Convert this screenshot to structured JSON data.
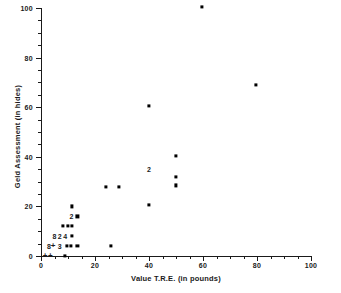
{
  "chart_data": {
    "type": "scatter",
    "title": "",
    "xlabel": "Value T.R.E. (in pounds)",
    "ylabel": "Geld Assessment (in hides)",
    "xlim": [
      0,
      100
    ],
    "ylim": [
      0,
      100
    ],
    "grid": false,
    "legend": false,
    "x_ticks_major": [
      0,
      20,
      40,
      60,
      80,
      100
    ],
    "x_ticks_minor": [
      5,
      10,
      15,
      25,
      30,
      35,
      45,
      50,
      55,
      65,
      70,
      75,
      85,
      90,
      95
    ],
    "y_ticks_major": [
      0,
      20,
      40,
      60,
      80,
      100
    ],
    "y_ticks_minor": [
      5,
      10,
      15,
      25,
      30,
      35,
      45,
      50,
      55,
      65,
      70,
      75,
      85,
      90,
      95
    ],
    "x_tick_labels": [
      "0",
      "20",
      "40",
      "60",
      "80",
      "100"
    ],
    "y_tick_labels": [
      "0",
      "20",
      "40",
      "60",
      "80",
      "100"
    ],
    "points": [
      {
        "x": 59.5,
        "y": 100.5
      },
      {
        "x": 79.5,
        "y": 69.0
      },
      {
        "x": 40.0,
        "y": 60.5
      },
      {
        "x": 50.0,
        "y": 40.5
      },
      {
        "x": 50.0,
        "y": 32.0
      },
      {
        "x": 50.0,
        "y": 28.5
      },
      {
        "x": 24.0,
        "y": 28.0
      },
      {
        "x": 29.0,
        "y": 28.0
      },
      {
        "x": 40.0,
        "y": 20.5
      },
      {
        "x": 11.5,
        "y": 20.0
      },
      {
        "x": 13.5,
        "y": 16.0
      },
      {
        "x": 8.0,
        "y": 12.0
      },
      {
        "x": 10.0,
        "y": 12.0
      },
      {
        "x": 11.5,
        "y": 12.0
      },
      {
        "x": 11.5,
        "y": 8.0
      },
      {
        "x": 9.5,
        "y": 4.0
      },
      {
        "x": 11.0,
        "y": 4.0
      },
      {
        "x": 13.5,
        "y": 4.0
      },
      {
        "x": 26.0,
        "y": 4.0
      },
      {
        "x": 9.0,
        "y": 0.0
      }
    ],
    "count_labels": [
      {
        "x": 40.0,
        "y": 35.0,
        "text": "2"
      },
      {
        "x": 11.3,
        "y": 16.0,
        "text": "2"
      },
      {
        "x": 5.0,
        "y": 8.0,
        "text": "8"
      },
      {
        "x": 7.0,
        "y": 8.0,
        "text": "2"
      },
      {
        "x": 9.0,
        "y": 8.0,
        "text": "4"
      },
      {
        "x": 3.0,
        "y": 4.0,
        "text": "8"
      },
      {
        "x": 7.0,
        "y": 4.0,
        "text": "3"
      }
    ],
    "plus_markers": [
      {
        "x": 4.5,
        "y": 4.0,
        "text": "+"
      },
      {
        "x": 1.5,
        "y": 0.0,
        "text": "+"
      },
      {
        "x": 3.5,
        "y": 0.0,
        "text": "+"
      }
    ]
  }
}
